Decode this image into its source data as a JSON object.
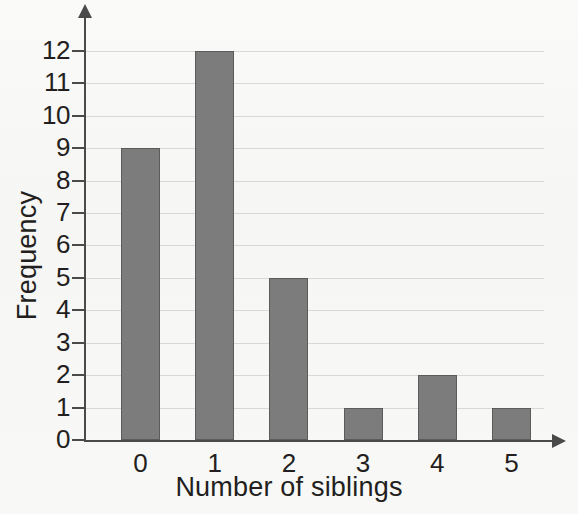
{
  "chart_data": {
    "type": "bar",
    "title": "",
    "xlabel": "Number of siblings",
    "ylabel": "Frequency",
    "categories": [
      "0",
      "1",
      "2",
      "3",
      "4",
      "5"
    ],
    "values": [
      9,
      12,
      5,
      1,
      2,
      1
    ],
    "ylim": [
      0,
      12
    ],
    "xlim_categories": 6,
    "ytick_labels": [
      "0",
      "1",
      "2",
      "3",
      "4",
      "5",
      "6",
      "7",
      "8",
      "9",
      "10",
      "11",
      "12"
    ],
    "ytick_values": [
      0,
      1,
      2,
      3,
      4,
      5,
      6,
      7,
      8,
      9,
      10,
      11,
      12
    ],
    "grid": true,
    "grid_axis": "y",
    "legend": "none",
    "series": [
      {
        "name": "Frequency",
        "values": [
          9,
          12,
          5,
          1,
          2,
          1
        ]
      }
    ],
    "bar_color": "#7c7c7c",
    "bar_edge_color": "#5b5b5b",
    "axis_color": "#4a4a4a",
    "grid_color": "#d8d8d6",
    "background_color": "#f7f7f5",
    "text_color": "#231f20",
    "axis_arrows": true
  }
}
